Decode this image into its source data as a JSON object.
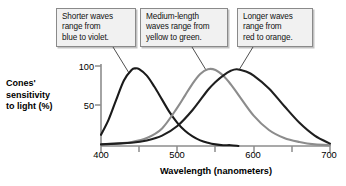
{
  "figure": {
    "callouts": [
      {
        "id": "short",
        "text": "Shorter waves\nrange from\nblue to violet."
      },
      {
        "id": "medium",
        "text": "Medium-length\nwaves range from\nyellow to green."
      },
      {
        "id": "long",
        "text": "Longer waves\nrange from\nred to orange."
      }
    ]
  },
  "chart_data": {
    "type": "line",
    "title": "",
    "xlabel": "Wavelength (nanometers)",
    "ylabel": "Cones'\nsensitivity\nto light (%)",
    "xlim": [
      400,
      700
    ],
    "ylim": [
      0,
      100
    ],
    "xticks": [
      400,
      450,
      500,
      550,
      600,
      650,
      700
    ],
    "xtick_labels": [
      "400",
      "",
      "500",
      "",
      "600",
      "",
      "700"
    ],
    "yticks": [
      50,
      100
    ],
    "ytick_labels": [
      "50",
      "100"
    ],
    "grid": false,
    "legend": "none",
    "series": [
      {
        "name": "Short-wavelength cones (blue to violet)",
        "color": "#1a1a1a",
        "peak_x": 445,
        "peak_y": 97,
        "x": [
          400,
          410,
          420,
          430,
          440,
          445,
          450,
          460,
          470,
          480,
          490,
          500,
          510,
          520,
          530,
          540,
          550,
          560,
          570,
          580
        ],
        "values": [
          14,
          33,
          58,
          82,
          95,
          97,
          96,
          88,
          74,
          58,
          42,
          29,
          19,
          12,
          7,
          4,
          2,
          1,
          1,
          0
        ]
      },
      {
        "name": "Medium-wavelength cones (yellow to green)",
        "color": "#8c8c8c",
        "peak_x": 540,
        "peak_y": 96,
        "x": [
          400,
          420,
          440,
          460,
          480,
          500,
          510,
          520,
          530,
          540,
          550,
          560,
          570,
          580,
          600,
          620,
          640,
          660,
          680,
          700
        ],
        "values": [
          2,
          3,
          5,
          10,
          22,
          48,
          63,
          78,
          90,
          96,
          95,
          88,
          77,
          64,
          38,
          20,
          10,
          5,
          2,
          1
        ]
      },
      {
        "name": "Long-wavelength cones (red to orange)",
        "color": "#1f1f1f",
        "peak_x": 578,
        "peak_y": 96,
        "x": [
          400,
          420,
          440,
          460,
          480,
          500,
          520,
          540,
          550,
          560,
          570,
          578,
          590,
          600,
          620,
          640,
          660,
          680,
          700
        ],
        "values": [
          2,
          3,
          4,
          7,
          13,
          25,
          45,
          70,
          80,
          88,
          94,
          96,
          93,
          88,
          72,
          50,
          29,
          13,
          3
        ]
      }
    ]
  }
}
